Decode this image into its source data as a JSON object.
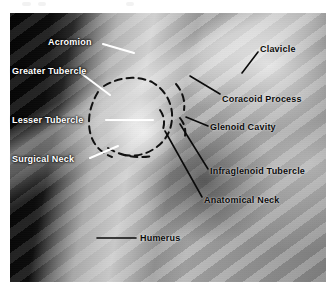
{
  "figure": {
    "kind": "annotated-radiograph",
    "region": "shoulder",
    "plate": {
      "left": 10,
      "top": 13,
      "width": 316,
      "height": 269
    }
  },
  "colors": {
    "page_background": "#ffffff",
    "light_label": "#ffffff",
    "dark_label": "#0b0b0b",
    "light_leader": "#ffffff",
    "dark_leader": "#0b0b0b",
    "dashed_outline": "#111111"
  },
  "artifacts": [
    {
      "name": "scan-speck-1",
      "x": 22,
      "y": 2,
      "w": 9,
      "h": 4
    },
    {
      "name": "scan-speck-2",
      "x": 38,
      "y": 2,
      "w": 8,
      "h": 4
    },
    {
      "name": "scan-speck-3",
      "x": 126,
      "y": 2,
      "w": 8,
      "h": 4
    }
  ],
  "labels": [
    {
      "id": "acromion",
      "text": "Acromion",
      "tone": "light",
      "x": 48,
      "y": 38,
      "leader": {
        "x1": 103,
        "y1": 44,
        "x2": 134,
        "y2": 53
      }
    },
    {
      "id": "greater-tubercle",
      "text": "Greater Tubercle",
      "tone": "light",
      "x": 12,
      "y": 67,
      "leader": {
        "x1": 82,
        "y1": 74,
        "x2": 110,
        "y2": 95
      }
    },
    {
      "id": "lesser-tubercle",
      "text": "Lesser Tubercle",
      "tone": "light",
      "x": 12,
      "y": 116,
      "leader": {
        "x1": 106,
        "y1": 120,
        "x2": 153,
        "y2": 120
      }
    },
    {
      "id": "surgical-neck",
      "text": "Surgical Neck",
      "tone": "light",
      "x": 12,
      "y": 155,
      "leader": {
        "x1": 90,
        "y1": 158,
        "x2": 118,
        "y2": 146
      }
    },
    {
      "id": "clavicle",
      "text": "Clavicle",
      "tone": "dark",
      "x": 260,
      "y": 45,
      "leader": {
        "x1": 258,
        "y1": 52,
        "x2": 242,
        "y2": 73
      }
    },
    {
      "id": "coracoid-process",
      "text": "Coracoid Process",
      "tone": "dark",
      "x": 222,
      "y": 95,
      "leader": {
        "x1": 220,
        "y1": 94,
        "x2": 190,
        "y2": 76
      }
    },
    {
      "id": "glenoid-cavity",
      "text": "Glenoid Cavity",
      "tone": "dark",
      "x": 210,
      "y": 123,
      "leader": {
        "x1": 208,
        "y1": 126,
        "x2": 186,
        "y2": 117
      }
    },
    {
      "id": "infraglenoid-tubercle",
      "text": "Infraglenoid Tubercle",
      "tone": "dark",
      "x": 210,
      "y": 167,
      "leader": {
        "x1": 208,
        "y1": 169,
        "x2": 180,
        "y2": 124
      }
    },
    {
      "id": "anatomical-neck",
      "text": "Anatomical Neck",
      "tone": "dark",
      "x": 204,
      "y": 196,
      "leader": {
        "x1": 202,
        "y1": 197,
        "x2": 165,
        "y2": 131
      }
    },
    {
      "id": "humerus",
      "text": "Humerus",
      "tone": "dark",
      "x": 140,
      "y": 234,
      "leader": {
        "x1": 97,
        "y1": 238,
        "x2": 136,
        "y2": 238
      }
    }
  ],
  "dashed_outlines": [
    {
      "id": "humeral-head-anatomical-neck",
      "path": "M 104 86 Q 128 72 152 82 Q 170 93 172 113 Q 173 134 158 146 Q 143 158 124 155"
    },
    {
      "id": "tubercle-arc",
      "path": "M 98 92 Q 86 112 90 132 Q 94 150 112 157"
    },
    {
      "id": "surgical-neck-line",
      "path": "M 108 148 Q 128 160 152 156"
    },
    {
      "id": "glenoid-rim-upper",
      "path": "M 176 84 Q 186 96 184 110"
    },
    {
      "id": "glenoid-rim-lower",
      "path": "M 180 118 Q 188 128 184 140"
    },
    {
      "id": "glenoid-inner",
      "path": "M 160 110 Q 167 120 162 132"
    }
  ]
}
